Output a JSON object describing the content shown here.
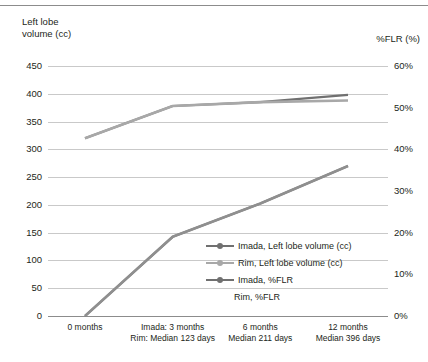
{
  "axes": {
    "left_title": "Left lobe\nvolume (cc)",
    "right_title": "%FLR (%)",
    "left_ticks": [
      "450",
      "400",
      "350",
      "300",
      "250",
      "200",
      "150",
      "100",
      "50",
      "0"
    ],
    "right_ticks": [
      "60%",
      "50%",
      "40%",
      "30%",
      "20%",
      "10%",
      "0%"
    ]
  },
  "xlabels": [
    "0 months",
    "Imada: 3 months\nRim: Median 123 days",
    "6 months\nMedian 211 days",
    "12 months\nMedian 396 days"
  ],
  "legend": [
    {
      "label": "Imada, Left lobe volume (cc)",
      "color": "#707070",
      "marker": true
    },
    {
      "label": "Rim, Left lobe volume (cc)",
      "color": "#a8a8a8",
      "marker": true
    },
    {
      "label": "Imada, %FLR",
      "color": "#707070",
      "marker": true
    },
    {
      "label": "Rim, %FLR",
      "color": "#8f8f8f",
      "marker": false
    }
  ],
  "colors": {
    "grid": "#c9c9c9",
    "axis": "#8c8c8c",
    "text": "#231f20",
    "imada_volume": "#707070",
    "rim_volume": "#a8a8a8",
    "imada_flr": "#707070",
    "rim_flr": "#8f8f8f"
  },
  "chart_data": {
    "type": "line",
    "title": "",
    "xlabel": "",
    "ylabel": "Left lobe volume (cc)",
    "y2label": "%FLR (%)",
    "categories": [
      "0 months",
      "Imada: 3 months / Rim: Median 123 days",
      "6 months / Median 211 days",
      "12 months / Median 396 days"
    ],
    "ylim": [
      0,
      450
    ],
    "y2lim": [
      0,
      60
    ],
    "yticks": [
      0,
      50,
      100,
      150,
      200,
      250,
      300,
      350,
      400,
      450
    ],
    "y2ticks": [
      0,
      10,
      20,
      30,
      40,
      50,
      60
    ],
    "grid": true,
    "legend_position": "center-right",
    "series": [
      {
        "name": "Imada, Left lobe volume (cc)",
        "axis": "left",
        "values": [
          320,
          378,
          385,
          398
        ]
      },
      {
        "name": "Rim, Left lobe volume (cc)",
        "axis": "left",
        "values": [
          320,
          378,
          385,
          388
        ]
      },
      {
        "name": "Imada, %FLR",
        "axis": "right",
        "values": [
          0,
          19,
          27,
          36
        ]
      },
      {
        "name": "Rim, %FLR",
        "axis": "right",
        "values": [
          0,
          19,
          27,
          36
        ]
      }
    ]
  }
}
